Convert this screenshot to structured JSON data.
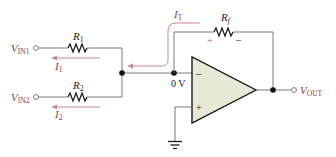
{
  "diagram": {
    "type": "summing-amplifier",
    "colors": {
      "wire": "#7a7a7a",
      "component": "#1a1a1a",
      "label": "#8a3c4c",
      "current_arrow": "#c98a94",
      "opamp_fill": "#e9e7d6",
      "node": "#111111"
    },
    "inputs": [
      {
        "label_main": "V",
        "label_sub": "IN1",
        "resistor": {
          "main": "R",
          "sub": "1"
        },
        "current": {
          "main": "I",
          "sub": "1"
        }
      },
      {
        "label_main": "V",
        "label_sub": "IN2",
        "resistor": {
          "main": "R",
          "sub": "2"
        },
        "current": {
          "main": "I",
          "sub": "2"
        }
      }
    ],
    "feedback": {
      "resistor": {
        "main": "R",
        "sub": "f"
      },
      "plus": "+",
      "minus": "–",
      "current": {
        "main": "I",
        "sub": "T"
      }
    },
    "opamp": {
      "inverting": "–",
      "noninverting": "+",
      "virtual_ground": "0 V"
    },
    "output": {
      "label_main": "V",
      "label_sub": "OUT"
    }
  }
}
